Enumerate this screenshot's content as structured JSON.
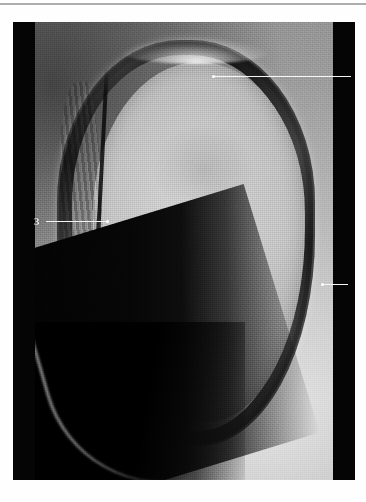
{
  "figure": {
    "kind": "annotated-anatomical-photograph",
    "modality": "grayscale-macro-photograph",
    "orientation": "transverse section, specimen centred on a dark mount",
    "plate": {
      "background_color": "#050505",
      "page_color": "#ffffff",
      "rule_color": "#9a9a9a"
    },
    "annotation_style": {
      "leader_color": "#f4f4f4",
      "dot_color": "#ffffff",
      "numeral_color": "#f2f2f2"
    },
    "labels": [
      {
        "id": "1",
        "number": "1",
        "side": "right",
        "target": "outer glossy keratin ring, lateral aspect",
        "leader": {
          "from_x": 310,
          "to_x": 335,
          "y": 262
        }
      },
      {
        "id": "2",
        "number": "2",
        "side": "right",
        "target": "proximal margin of the capsule at the dorsal curve",
        "leader": {
          "from_x": 201,
          "to_x": 338,
          "y": 54
        }
      },
      {
        "id": "3",
        "number": "3",
        "side": "left",
        "target": "striated inner layer of the keratin band, medial aspect",
        "leader": {
          "from_x": 33,
          "to_x": 95,
          "y": 199
        }
      }
    ],
    "regions": [
      {
        "name": "outer-ring",
        "description": "dark glossy keratin band with wet specular highlights"
      },
      {
        "name": "inner-core",
        "description": "pale finely granular cut surface"
      },
      {
        "name": "soft-tissue",
        "description": "surrounding lighter tissue field"
      },
      {
        "name": "dark-wedge",
        "description": "shadowed diagonal area at the lower left"
      }
    ]
  }
}
